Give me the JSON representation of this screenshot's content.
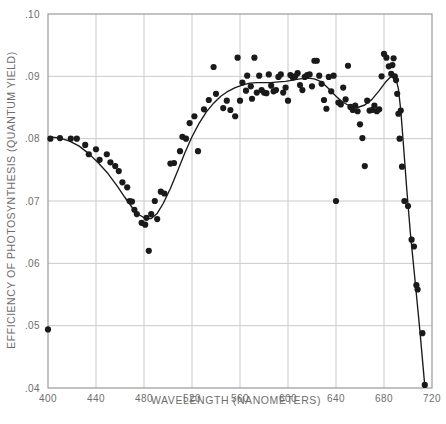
{
  "figure": {
    "title": "",
    "background": "#ffffff",
    "axis_color": "#9a9a9a",
    "grid_color": "#c9c9c9",
    "point_color": "#1a1a1a",
    "curve_color": "#1a1a1a",
    "tick_label_color": "#6e6e6e"
  },
  "chart_data": {
    "type": "scatter",
    "title": "",
    "subtitle": "",
    "xlabel": "WAVELENGTH (NANOMETERS)",
    "ylabel": "EFFICIENCY OF PHOTOSYNTHESIS (QUANTUM YIELD)",
    "xlim": [
      400,
      720
    ],
    "ylim": [
      0.04,
      0.1
    ],
    "xticks": [
      400,
      440,
      480,
      520,
      560,
      600,
      640,
      680,
      720
    ],
    "xticklabels": [
      "400",
      "440",
      "480",
      "520",
      "560",
      "600",
      "640",
      "680",
      "720"
    ],
    "yticks": [
      0.04,
      0.05,
      0.06,
      0.07,
      0.08,
      0.09,
      0.1
    ],
    "yticklabels": [
      ".04",
      ".05",
      ".06",
      ".07",
      ".08",
      ".09",
      ".10"
    ],
    "grid": true,
    "grid_axes": "both",
    "legend": false,
    "legend_position": "none",
    "series": [
      {
        "name": "measured quantum yield",
        "marker": "filled-circle",
        "marker_size": 3.1,
        "points": [
          [
            400,
            0.0494
          ],
          [
            402,
            0.08
          ],
          [
            410,
            0.0801
          ],
          [
            419,
            0.08
          ],
          [
            424,
            0.08
          ],
          [
            431,
            0.079
          ],
          [
            434,
            0.0775
          ],
          [
            440,
            0.0783
          ],
          [
            443,
            0.0766
          ],
          [
            449,
            0.0775
          ],
          [
            452,
            0.0762
          ],
          [
            456,
            0.0756
          ],
          [
            459,
            0.0748
          ],
          [
            462,
            0.073
          ],
          [
            466,
            0.0722
          ],
          [
            468,
            0.07
          ],
          [
            470,
            0.0699
          ],
          [
            472,
            0.0686
          ],
          [
            474,
            0.0679
          ],
          [
            478,
            0.0665
          ],
          [
            481,
            0.0662
          ],
          [
            482,
            0.0673
          ],
          [
            484,
            0.062
          ],
          [
            486,
            0.0679
          ],
          [
            489,
            0.07
          ],
          [
            491,
            0.0671
          ],
          [
            494,
            0.0715
          ],
          [
            497,
            0.0712
          ],
          [
            502,
            0.076
          ],
          [
            505,
            0.0761
          ],
          [
            510,
            0.078
          ],
          [
            512,
            0.0803
          ],
          [
            515,
            0.08
          ],
          [
            518,
            0.0825
          ],
          [
            522,
            0.0836
          ],
          [
            525,
            0.078
          ],
          [
            530,
            0.0847
          ],
          [
            534,
            0.0862
          ],
          [
            538,
            0.0915
          ],
          [
            540,
            0.0872
          ],
          [
            546,
            0.0849
          ],
          [
            549,
            0.0861
          ],
          [
            552,
            0.0846
          ],
          [
            556,
            0.0836
          ],
          [
            558,
            0.093
          ],
          [
            560,
            0.0861
          ],
          [
            562,
            0.089
          ],
          [
            565,
            0.0877
          ],
          [
            566,
            0.0901
          ],
          [
            569,
            0.0884
          ],
          [
            570,
            0.0864
          ],
          [
            572,
            0.093
          ],
          [
            574,
            0.0874
          ],
          [
            576,
            0.0901
          ],
          [
            578,
            0.0878
          ],
          [
            580,
            0.0874
          ],
          [
            582,
            0.0873
          ],
          [
            584,
            0.0903
          ],
          [
            586,
            0.0885
          ],
          [
            588,
            0.0876
          ],
          [
            590,
            0.0878
          ],
          [
            592,
            0.0899
          ],
          [
            594,
            0.0903
          ],
          [
            596,
            0.0874
          ],
          [
            598,
            0.0882
          ],
          [
            600,
            0.0861
          ],
          [
            602,
            0.0902
          ],
          [
            604,
            0.0898
          ],
          [
            606,
            0.09
          ],
          [
            608,
            0.0905
          ],
          [
            610,
            0.0886
          ],
          [
            612,
            0.0878
          ],
          [
            614,
            0.0899
          ],
          [
            616,
            0.0902
          ],
          [
            618,
            0.0903
          ],
          [
            620,
            0.0884
          ],
          [
            622,
            0.0925
          ],
          [
            624,
            0.0925
          ],
          [
            626,
            0.0901
          ],
          [
            628,
            0.0888
          ],
          [
            630,
            0.0862
          ],
          [
            632,
            0.0848
          ],
          [
            634,
            0.0899
          ],
          [
            636,
            0.0876
          ],
          [
            638,
            0.0901
          ],
          [
            640,
            0.07
          ],
          [
            642,
            0.0858
          ],
          [
            644,
            0.0855
          ],
          [
            646,
            0.0882
          ],
          [
            648,
            0.0863
          ],
          [
            650,
            0.0917
          ],
          [
            652,
            0.0851
          ],
          [
            654,
            0.0846
          ],
          [
            656,
            0.0853
          ],
          [
            658,
            0.0844
          ],
          [
            660,
            0.0823
          ],
          [
            662,
            0.0801
          ],
          [
            664,
            0.0756
          ],
          [
            666,
            0.0861
          ],
          [
            668,
            0.0845
          ],
          [
            670,
            0.0846
          ],
          [
            672,
            0.0853
          ],
          [
            674,
            0.0844
          ],
          [
            676,
            0.0847
          ],
          [
            678,
            0.09
          ],
          [
            680,
            0.0936
          ],
          [
            682,
            0.093
          ],
          [
            684,
            0.0916
          ],
          [
            686,
            0.0904
          ],
          [
            687,
            0.0918
          ],
          [
            688,
            0.0929
          ],
          [
            689,
            0.09
          ],
          [
            690,
            0.0894
          ],
          [
            691,
            0.0872
          ],
          [
            692,
            0.084
          ],
          [
            693,
            0.08
          ],
          [
            694,
            0.0845
          ],
          [
            695,
            0.0755
          ],
          [
            697,
            0.07
          ],
          [
            700,
            0.0692
          ],
          [
            703,
            0.0638
          ],
          [
            705,
            0.0627
          ],
          [
            707,
            0.0565
          ],
          [
            708,
            0.0558
          ],
          [
            712,
            0.0488
          ],
          [
            714,
            0.0405
          ]
        ]
      },
      {
        "name": "fitted action spectrum curve",
        "marker": "none",
        "line": "solid",
        "points": [
          [
            401,
            0.0803
          ],
          [
            410,
            0.0801
          ],
          [
            418,
            0.0796
          ],
          [
            426,
            0.0788
          ],
          [
            434,
            0.0776
          ],
          [
            442,
            0.0761
          ],
          [
            450,
            0.0744
          ],
          [
            458,
            0.0723
          ],
          [
            464,
            0.0706
          ],
          [
            470,
            0.069
          ],
          [
            476,
            0.0678
          ],
          [
            481,
            0.0672
          ],
          [
            486,
            0.0672
          ],
          [
            491,
            0.068
          ],
          [
            496,
            0.0696
          ],
          [
            502,
            0.072
          ],
          [
            508,
            0.0748
          ],
          [
            514,
            0.0777
          ],
          [
            520,
            0.0803
          ],
          [
            526,
            0.0825
          ],
          [
            532,
            0.0843
          ],
          [
            538,
            0.0857
          ],
          [
            544,
            0.0868
          ],
          [
            550,
            0.0876
          ],
          [
            556,
            0.0882
          ],
          [
            562,
            0.0886
          ],
          [
            568,
            0.0889
          ],
          [
            574,
            0.089
          ],
          [
            580,
            0.089
          ],
          [
            586,
            0.089
          ],
          [
            592,
            0.0891
          ],
          [
            598,
            0.0892
          ],
          [
            604,
            0.0894
          ],
          [
            610,
            0.0896
          ],
          [
            616,
            0.0897
          ],
          [
            622,
            0.0896
          ],
          [
            628,
            0.0891
          ],
          [
            634,
            0.088
          ],
          [
            640,
            0.0868
          ],
          [
            646,
            0.0858
          ],
          [
            652,
            0.0852
          ],
          [
            658,
            0.085
          ],
          [
            664,
            0.0854
          ],
          [
            670,
            0.0863
          ],
          [
            676,
            0.0877
          ],
          [
            681,
            0.089
          ],
          [
            685,
            0.0898
          ],
          [
            688,
            0.09
          ],
          [
            690,
            0.0896
          ],
          [
            692,
            0.088
          ],
          [
            694,
            0.0845
          ],
          [
            696,
            0.0795
          ],
          [
            699,
            0.0718
          ],
          [
            702,
            0.0648
          ],
          [
            706,
            0.057
          ],
          [
            710,
            0.049
          ],
          [
            714,
            0.0403
          ]
        ]
      }
    ]
  }
}
